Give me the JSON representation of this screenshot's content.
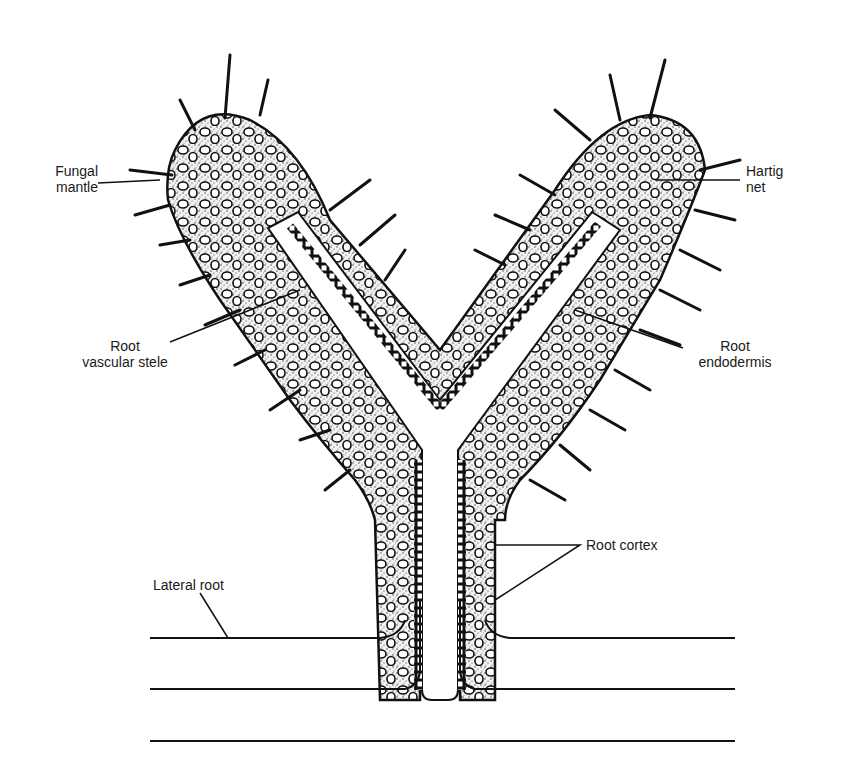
{
  "figure": {
    "labels": {
      "fungal_mantle": {
        "line1": "Fungal",
        "line2": "mantle"
      },
      "hartig_net": {
        "line1": "Hartig",
        "line2": "net"
      },
      "root_vascular_stele": {
        "line1": "Root",
        "line2": "vascular stele"
      },
      "root_endodermis": {
        "line1": "Root",
        "line2": "endodermis"
      },
      "root_cortex": {
        "line1": "Root cortex"
      },
      "lateral_root": {
        "line1": "Lateral root"
      }
    }
  }
}
